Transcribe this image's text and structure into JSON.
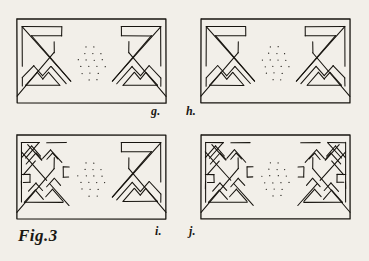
{
  "plate": {
    "figure_caption": "Fig.3",
    "background_color": "#f2efe9",
    "ink_color": "#17140f",
    "medium": "engraving",
    "panel_count": 4
  },
  "panels": [
    {
      "id": "g",
      "label": "g.",
      "label_x": 151,
      "label_y": 104,
      "x": 17,
      "y": 19,
      "w": 149,
      "h": 84,
      "left_motif": "chevron-triangle",
      "right_motif": "chevron-triangle",
      "dot_lattice": true
    },
    {
      "id": "h",
      "label": "h.",
      "label_x": 186,
      "label_y": 104,
      "x": 201,
      "y": 19,
      "w": 149,
      "h": 84,
      "left_motif": "chevron-triangle",
      "right_motif": "chevron-triangle",
      "dot_lattice": true
    },
    {
      "id": "i",
      "label": "i.",
      "label_x": 155,
      "label_y": 224,
      "x": 17,
      "y": 135,
      "w": 149,
      "h": 84,
      "left_motif": "interlace-knot",
      "right_motif": "chevron-triangle",
      "dot_lattice": true
    },
    {
      "id": "j",
      "label": "j.",
      "label_x": 189,
      "label_y": 224,
      "x": 201,
      "y": 135,
      "w": 149,
      "h": 84,
      "left_motif": "interlace-knot",
      "right_motif": "interlace-knot",
      "dot_lattice": true
    }
  ],
  "figure_label": {
    "text": "Fig.3",
    "x": 18,
    "y": 226
  }
}
